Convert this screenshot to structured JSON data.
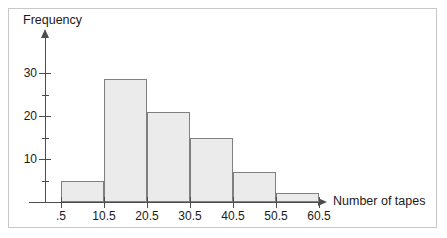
{
  "figure": {
    "background_color": "#ffffff",
    "frame_color": "#c8c8c8",
    "axis_color": "#4d4d4d",
    "bar_fill_color": "#ebebeb",
    "bar_stroke_color": "#808080"
  },
  "chart_data": {
    "type": "bar",
    "title": "",
    "subtitle": "",
    "xlabel": "Number of tapes",
    "ylabel": "Frequency",
    "categories": [
      ".5-10.5",
      "10.5-20.5",
      "20.5-30.5",
      "30.5-40.5",
      "40.5-50.5",
      "50.5-60.5"
    ],
    "bin_edges": [
      0.5,
      10.5,
      20.5,
      30.5,
      40.5,
      50.5,
      60.5
    ],
    "values": [
      5,
      28.5,
      21,
      15,
      7,
      2
    ],
    "xlim": [
      0.5,
      60.5
    ],
    "ylim": [
      0,
      33
    ],
    "x_tick_labels": [
      ".5",
      "10.5",
      "20.5",
      "30.5",
      "40.5",
      "50.5",
      "60.5"
    ],
    "x_tick_values": [
      0.5,
      10.5,
      20.5,
      30.5,
      40.5,
      50.5,
      60.5
    ],
    "y_tick_labels": [
      "10",
      "20",
      "30"
    ],
    "y_tick_values": [
      10,
      20,
      30
    ],
    "y_minor_tick_values": [
      5,
      15,
      25
    ],
    "grid": false,
    "legend": null,
    "legend_position": "none",
    "annotations": [],
    "axis_arrows": {
      "x": true,
      "y": true
    }
  },
  "axis_titles": {
    "y": "Frequency",
    "x": "Number of tapes"
  }
}
